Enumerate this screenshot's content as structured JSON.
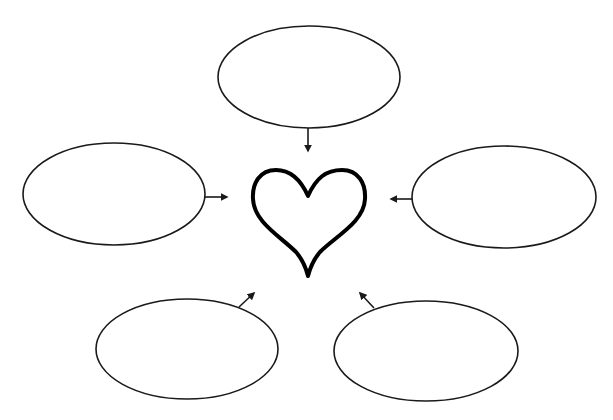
{
  "diagram": {
    "type": "bubble-map",
    "center": {
      "shape": "heart",
      "icon": "heart-outline-icon",
      "label": ""
    },
    "stroke_color": "#1a1a1a",
    "background": "#ffffff",
    "bubbles": [
      {
        "id": "top",
        "label": "",
        "arrow_direction": "down"
      },
      {
        "id": "left",
        "label": "",
        "arrow_direction": "right"
      },
      {
        "id": "right",
        "label": "",
        "arrow_direction": "left"
      },
      {
        "id": "bottom-left",
        "label": "",
        "arrow_direction": "up-right"
      },
      {
        "id": "bottom-right",
        "label": "",
        "arrow_direction": "up-left"
      }
    ]
  }
}
